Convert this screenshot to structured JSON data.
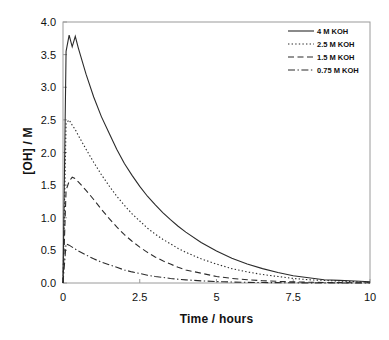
{
  "chart_data": {
    "type": "line",
    "title": "",
    "xlabel": "Time / hours",
    "ylabel": "[OH] / M",
    "xlim": [
      0,
      10
    ],
    "ylim": [
      0,
      4.0
    ],
    "grid": false,
    "legend_position": "top-right",
    "xticks": [
      "0",
      "2.5",
      "5",
      "7.5",
      "10"
    ],
    "xtick_values": [
      0,
      2.5,
      5,
      7.5,
      10
    ],
    "yticks": [
      "0.0",
      "0.5",
      "1.0",
      "1.5",
      "2.0",
      "2.5",
      "3.0",
      "3.5",
      "4.0"
    ],
    "ytick_values": [
      0.0,
      0.5,
      1.0,
      1.5,
      2.0,
      2.5,
      3.0,
      3.5,
      4.0
    ],
    "x": [
      0,
      0.1,
      0.2,
      0.3,
      0.4,
      0.5,
      0.75,
      1.0,
      1.25,
      1.5,
      1.75,
      2.0,
      2.25,
      2.5,
      2.75,
      3.0,
      3.25,
      3.5,
      3.75,
      4.0,
      4.5,
      5.0,
      5.5,
      6.0,
      6.5,
      7.0,
      7.5,
      8.0,
      8.5,
      9.0,
      9.5,
      10.0
    ],
    "series": [
      {
        "name": "4 M KOH",
        "style": "solid",
        "color": "#2b2b2b",
        "peak_value": 3.8,
        "peak_time": 0.3,
        "values": [
          0.0,
          3.55,
          3.8,
          3.62,
          3.78,
          3.6,
          3.2,
          2.85,
          2.55,
          2.3,
          2.05,
          1.83,
          1.65,
          1.48,
          1.33,
          1.2,
          1.08,
          0.97,
          0.87,
          0.78,
          0.62,
          0.49,
          0.38,
          0.29,
          0.22,
          0.16,
          0.11,
          0.08,
          0.05,
          0.04,
          0.03,
          0.02
        ]
      },
      {
        "name": "2.5 M KOH",
        "style": "dotted",
        "color": "#2b2b2b",
        "peak_value": 2.5,
        "peak_time": 0.15,
        "values": [
          0.0,
          2.45,
          2.5,
          2.42,
          2.35,
          2.26,
          2.05,
          1.85,
          1.66,
          1.49,
          1.33,
          1.19,
          1.06,
          0.95,
          0.84,
          0.75,
          0.67,
          0.6,
          0.53,
          0.47,
          0.37,
          0.29,
          0.22,
          0.17,
          0.13,
          0.1,
          0.07,
          0.05,
          0.04,
          0.03,
          0.02,
          0.01
        ]
      },
      {
        "name": "1.5 M KOH",
        "style": "dashed",
        "color": "#2b2b2b",
        "peak_value": 1.62,
        "peak_time": 0.35,
        "values": [
          0.0,
          1.42,
          1.56,
          1.62,
          1.6,
          1.55,
          1.42,
          1.28,
          1.13,
          0.99,
          0.86,
          0.74,
          0.64,
          0.55,
          0.47,
          0.4,
          0.34,
          0.29,
          0.24,
          0.2,
          0.15,
          0.1,
          0.07,
          0.05,
          0.035,
          0.025,
          0.018,
          0.012,
          0.008,
          0.006,
          0.004,
          0.003
        ]
      },
      {
        "name": "0.75 M KOH",
        "style": "dashdot",
        "color": "#2b2b2b",
        "peak_value": 0.6,
        "peak_time": 0.08,
        "values": [
          0.0,
          0.6,
          0.58,
          0.55,
          0.52,
          0.49,
          0.43,
          0.37,
          0.32,
          0.28,
          0.24,
          0.2,
          0.17,
          0.145,
          0.12,
          0.1,
          0.085,
          0.07,
          0.058,
          0.048,
          0.033,
          0.022,
          0.015,
          0.01,
          0.007,
          0.005,
          0.003,
          0.002,
          0.002,
          0.001,
          0.001,
          0.0
        ]
      }
    ]
  },
  "legend": {
    "entries": [
      {
        "label": "4 M KOH",
        "style": "solid"
      },
      {
        "label": "2.5 M KOH",
        "style": "dotted"
      },
      {
        "label": "1.5 M KOH",
        "style": "dashed"
      },
      {
        "label": "0.75 M KOH",
        "style": "dashdot"
      }
    ]
  },
  "axes": {
    "x_title": "Time / hours",
    "y_title": "[OH] / M"
  }
}
